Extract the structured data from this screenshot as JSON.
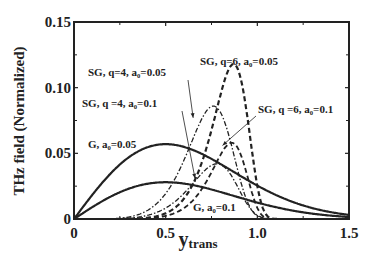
{
  "chart_data": {
    "type": "line",
    "title": "",
    "xlabel": "y",
    "xlabel_subscript": "trans",
    "ylabel": "THz field (Normalized)",
    "xlim": [
      0,
      1.5
    ],
    "ylim": [
      0,
      0.15
    ],
    "xticks": [
      0,
      0.5,
      1.0,
      1.5
    ],
    "xtick_labels": [
      "0",
      "0.5",
      "1.0",
      "1.5"
    ],
    "yticks": [
      0,
      0.05,
      0.1,
      0.15
    ],
    "ytick_labels": [
      "0",
      "0.05",
      "0.10",
      "0.15"
    ],
    "grid": false,
    "legend": "none (inline annotations with arrows)",
    "series": [
      {
        "name": "G, a0=0.05",
        "style": "solid",
        "width": 2.2,
        "peak_x": 0.5,
        "peak_y": 0.057,
        "profile": "gaussian",
        "sigma": 0.5,
        "annotation": {
          "text": "G, a₀=0.05",
          "x": 88,
          "y": 148
        }
      },
      {
        "name": "G, a0=0.1",
        "style": "solid",
        "width": 2.2,
        "peak_x": 0.5,
        "peak_y": 0.028,
        "profile": "gaussian",
        "sigma": 0.5,
        "annotation": {
          "text": "G, a₀=0.1",
          "x": 193,
          "y": 211
        }
      },
      {
        "name": "SG, q=4, a0=0.05",
        "style": "dashdot",
        "width": 1.3,
        "peak_x": 0.76,
        "peak_y": 0.086,
        "profile": "supergauss",
        "q": 4,
        "annotation": {
          "text": "SG, q=4, a₀=0.05",
          "x": 88,
          "y": 76,
          "arrow_to": [
            0.65,
            0.077
          ]
        }
      },
      {
        "name": "SG, q=4, a0=0.1",
        "style": "dashdot",
        "width": 1.3,
        "peak_x": 0.78,
        "peak_y": 0.042,
        "profile": "supergauss",
        "q": 4,
        "annotation": {
          "text": "SG, q =4, a₀=0.1",
          "x": 82,
          "y": 107,
          "arrow_to": [
            0.66,
            0.031
          ]
        }
      },
      {
        "name": "SG, q=6, a0=0.05",
        "style": "dashed",
        "width": 2.2,
        "peak_x": 0.87,
        "peak_y": 0.118,
        "profile": "supergauss",
        "q": 6,
        "annotation": {
          "text": "SG, q=6, a₀=0.05",
          "x": 200,
          "y": 65
        }
      },
      {
        "name": "SG, q=6, a0=0.1",
        "style": "dashed",
        "width": 1.8,
        "peak_x": 0.86,
        "peak_y": 0.058,
        "profile": "supergauss",
        "q": 6,
        "annotation": {
          "text": "SG, q =6, a₀=0.1",
          "x": 258,
          "y": 113,
          "arrow_to": [
            0.81,
            0.056
          ]
        }
      }
    ]
  },
  "labels": {
    "ylabel": "THz field (Normalized)",
    "xlabel_main": "y",
    "xlabel_sub": "trans"
  }
}
